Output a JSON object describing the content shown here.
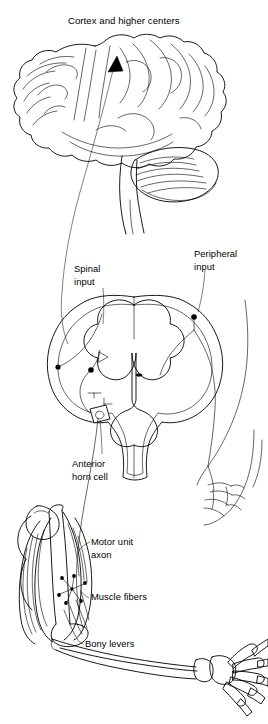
{
  "figure": {
    "kind": "anatomical-line-diagram",
    "background_color": "#ffffff",
    "line_color": "#000000",
    "width": 268,
    "height": 724
  },
  "title": {
    "text": "Cortex and higher centers"
  },
  "labels": {
    "spinal_input_line1": "Spinal",
    "spinal_input_line2": "input",
    "peripheral_input_line1": "Peripheral",
    "peripheral_input_line2": "input",
    "anterior_horn_cell_line1": "Anterior",
    "anterior_horn_cell_line2": "horn cell",
    "motor_unit_axon_line1": "Motor unit",
    "motor_unit_axon_line2": "axon",
    "muscle_fibers": "Muscle fibers",
    "bony_levers": "Bony levers"
  },
  "structures": [
    {
      "name": "cerebral-cortex",
      "label": "Cerebral cortex with gyri and sulci"
    },
    {
      "name": "cerebellum",
      "label": "Cerebellum with folia"
    },
    {
      "name": "brainstem",
      "label": "Brainstem"
    },
    {
      "name": "descending-tract-arrow",
      "label": "Ascending arrow to cortex"
    },
    {
      "name": "spinal-cord-cross-section",
      "label": "Spinal cord cross section with gray matter butterfly"
    },
    {
      "name": "dorsal-root-ganglion",
      "label": "Dorsal root ganglion cell body"
    },
    {
      "name": "interneuron-pool",
      "label": "Spinal interneurons"
    },
    {
      "name": "anterior-horn-cell-box",
      "label": "Boxed anterior horn cell"
    },
    {
      "name": "peripheral-nerve",
      "label": "Peripheral nerve to skin"
    },
    {
      "name": "sensory-endings",
      "label": "Cutaneous sensory nerve endings"
    },
    {
      "name": "biceps-muscle",
      "label": "Upper arm muscle with fascicles"
    },
    {
      "name": "motor-unit-star",
      "label": "Motor unit axon branching to muscle fibers"
    },
    {
      "name": "humerus",
      "label": "Humerus bone"
    },
    {
      "name": "forearm-bones",
      "label": "Radius and ulna"
    },
    {
      "name": "hand-skeleton",
      "label": "Carpals, metacarpals and phalanges"
    }
  ]
}
